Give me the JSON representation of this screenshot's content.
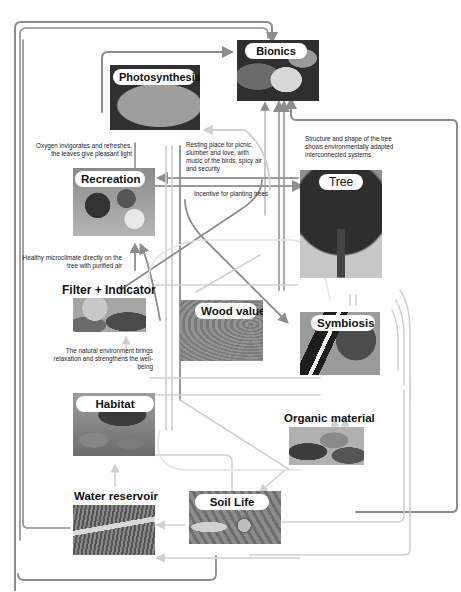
{
  "diagram": {
    "colors": {
      "arrow_dark": "#8c8c8c",
      "arrow_light": "#cfcfcf",
      "background": "#ffffff",
      "label_pill": "#ffffff",
      "text": "#111111"
    },
    "nodes": {
      "bionics": {
        "label": "Bionics",
        "icon": "leaf-image"
      },
      "photosynthesis": {
        "label": "Photosynthesis",
        "icon": "leaf-image"
      },
      "recreation": {
        "label": "Recreation",
        "icon": "people-in-forest-image"
      },
      "tree": {
        "label": "Tree",
        "icon": "tree-image"
      },
      "filter_indicator": {
        "label": "Filter + Indicator",
        "icon": "flower-leaves-image"
      },
      "wood_value": {
        "label": "Wood value",
        "icon": "wood-grain-image"
      },
      "symbiosis": {
        "label": "Symbiosis",
        "icon": "woodpecker-image"
      },
      "habitat": {
        "label": "Habitat",
        "icon": "mice-image"
      },
      "organic_material": {
        "label": "Organic material",
        "icon": "fallen-leaves-image"
      },
      "water_reservoir": {
        "label": "Water reservoir",
        "icon": "roots-water-image"
      },
      "soil_life": {
        "label": "Soil Life",
        "icon": "snail-soil-image"
      }
    },
    "annotations": {
      "oxygen": "Oxygen invigorates and refreshes, the leaves give pleasant light",
      "resting": "Resting place for picnic, slumber and love, with music of the birds, spicy air and security",
      "structure": "Structure and shape of the tree shows environmentally adapted interconnected systems",
      "incentive": "Incentive for planting trees",
      "microclimate": "Healthy microclimate directly on the tree with purified air",
      "natural_env": "The natural environment brings relaxation and strengthens the well-being"
    }
  }
}
